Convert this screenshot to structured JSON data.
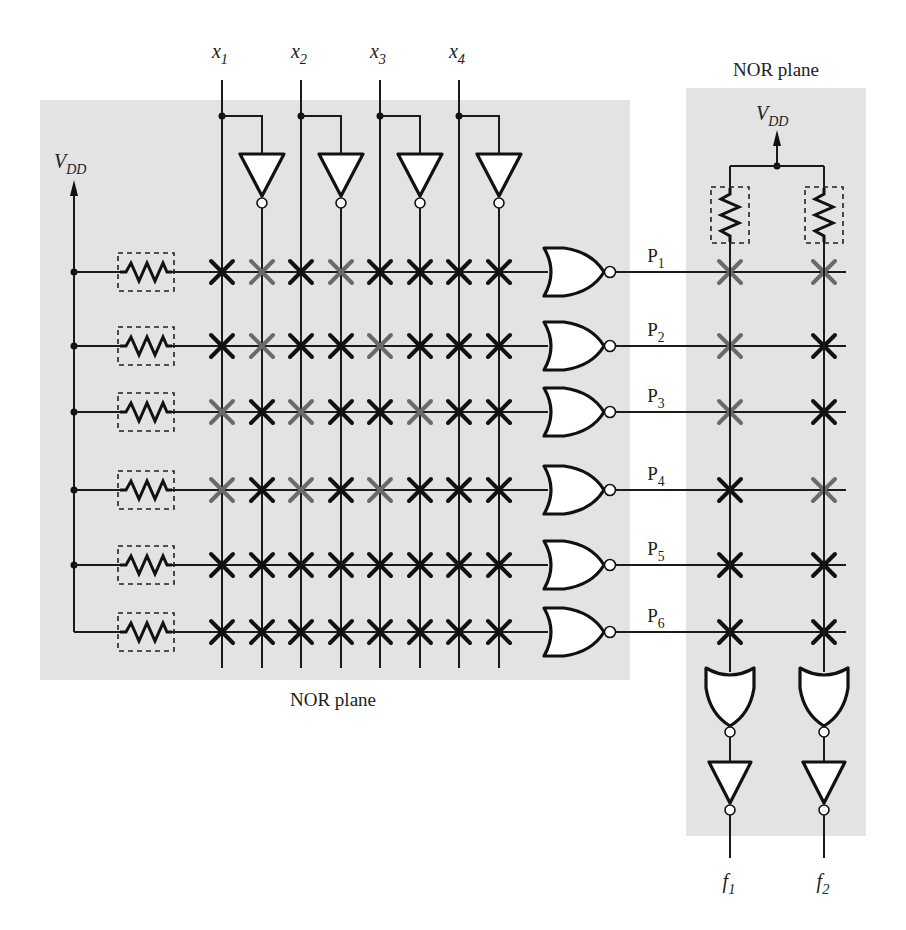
{
  "figure": {
    "and_plane_label": "NOR plane",
    "or_plane_label": "NOR plane",
    "vdd_label": {
      "main": "V",
      "sub": "DD"
    },
    "inputs": [
      {
        "main": "x",
        "sub": "1"
      },
      {
        "main": "x",
        "sub": "2"
      },
      {
        "main": "x",
        "sub": "3"
      },
      {
        "main": "x",
        "sub": "4"
      }
    ],
    "products": [
      {
        "main": "P",
        "sub": "1"
      },
      {
        "main": "P",
        "sub": "2"
      },
      {
        "main": "P",
        "sub": "3"
      },
      {
        "main": "P",
        "sub": "4"
      },
      {
        "main": "P",
        "sub": "5"
      },
      {
        "main": "P",
        "sub": "6"
      }
    ],
    "outputs": [
      {
        "main": "f",
        "sub": "1"
      },
      {
        "main": "f",
        "sub": "2"
      }
    ],
    "colors": {
      "panel_bg": "#e3e3e3",
      "programmed_cross": "#111111",
      "active_cross": "#6a6a6a"
    },
    "and_plane_columns": [
      "x1",
      "x1'",
      "x2",
      "x2'",
      "x3",
      "x3'",
      "x4",
      "x4'"
    ],
    "and_plane_crosspoints": [
      [
        "black",
        "gray",
        "black",
        "gray",
        "black",
        "black",
        "black",
        "black"
      ],
      [
        "black",
        "gray",
        "black",
        "black",
        "gray",
        "black",
        "black",
        "black"
      ],
      [
        "gray",
        "black",
        "gray",
        "black",
        "black",
        "gray",
        "black",
        "black"
      ],
      [
        "gray",
        "black",
        "gray",
        "black",
        "gray",
        "black",
        "black",
        "black"
      ],
      [
        "black",
        "black",
        "black",
        "black",
        "black",
        "black",
        "black",
        "black"
      ],
      [
        "black",
        "black",
        "black",
        "black",
        "black",
        "black",
        "black",
        "black"
      ]
    ],
    "or_plane_crosspoints": [
      [
        "gray",
        "gray"
      ],
      [
        "gray",
        "black"
      ],
      [
        "gray",
        "black"
      ],
      [
        "black",
        "gray"
      ],
      [
        "black",
        "black"
      ],
      [
        "black",
        "black"
      ]
    ]
  }
}
